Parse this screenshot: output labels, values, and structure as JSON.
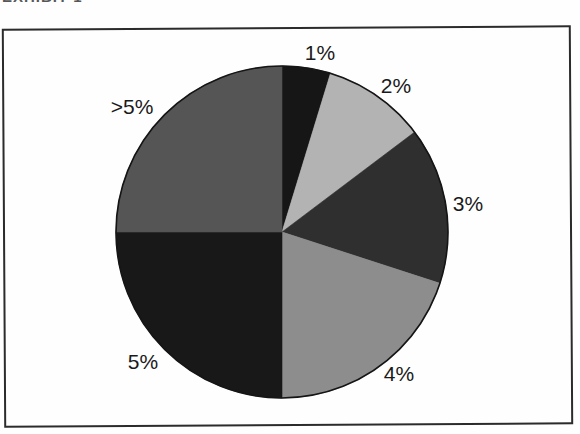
{
  "header": {
    "fragment": "EXHIBIT 1"
  },
  "chart_data": {
    "type": "pie",
    "title": "",
    "legend": "none",
    "categories": [
      "1%",
      "2%",
      "3%",
      "4%",
      "5%",
      ">5%"
    ],
    "values": [
      4.7,
      10.0,
      15.3,
      20.0,
      25.0,
      25.0
    ],
    "values_unit": "percent of whole (estimated from slice angles)",
    "slices": [
      {
        "label": "1%",
        "start_angle": 0,
        "sweep": 17,
        "color": "#161616"
      },
      {
        "label": "2%",
        "start_angle": 17,
        "sweep": 36,
        "color": "#b3b3b3"
      },
      {
        "label": "3%",
        "start_angle": 53,
        "sweep": 55,
        "color": "#2f2f2f"
      },
      {
        "label": "4%",
        "start_angle": 108,
        "sweep": 72,
        "color": "#8d8d8d"
      },
      {
        "label": "5%",
        "start_angle": 180,
        "sweep": 90,
        "color": "#181818"
      },
      {
        "label": ">5%",
        "start_angle": 270,
        "sweep": 90,
        "color": "#555555"
      }
    ],
    "label_color": "#1a1a1a",
    "outline_color": "#151515",
    "frame_color": "#2b2b2b"
  }
}
